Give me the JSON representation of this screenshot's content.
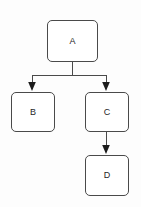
{
  "diagram": {
    "type": "flowchart",
    "width": 141,
    "height": 207,
    "background_color": "#fdfdfd",
    "stroke_color": "#4a4a4a",
    "node_fill_color": "#ffffff",
    "text_color": "#262626",
    "nodes": [
      {
        "id": "a",
        "label": "A",
        "x": 47,
        "y": 20,
        "width": 51,
        "height": 42,
        "shape": "rounded-rectangle"
      },
      {
        "id": "b",
        "label": "B",
        "x": 11,
        "y": 92,
        "width": 44,
        "height": 40,
        "shape": "rounded-rectangle"
      },
      {
        "id": "c",
        "label": "C",
        "x": 85,
        "y": 92,
        "width": 44,
        "height": 40,
        "shape": "rounded-rectangle"
      },
      {
        "id": "d",
        "label": "D",
        "x": 85,
        "y": 155,
        "width": 44,
        "height": 41,
        "shape": "rounded-rectangle"
      }
    ],
    "edges": [
      {
        "id": "a-b",
        "from": "A",
        "to": "B",
        "arrowhead": "filled-triangle",
        "style": "orthogonal"
      },
      {
        "id": "a-c",
        "from": "A",
        "to": "C",
        "arrowhead": "filled-triangle",
        "style": "orthogonal"
      },
      {
        "id": "c-d",
        "from": "C",
        "to": "D",
        "arrowhead": "filled-triangle",
        "style": "straight"
      }
    ],
    "geometry": {
      "trunk_x": 72,
      "trunk_top_y": 62,
      "bus_y": 75,
      "bus_left_x": 32,
      "bus_right_x": 106,
      "branch_tip_y": 90,
      "cd_x": 106,
      "cd_top_y": 132,
      "cd_tip_y": 153
    }
  }
}
